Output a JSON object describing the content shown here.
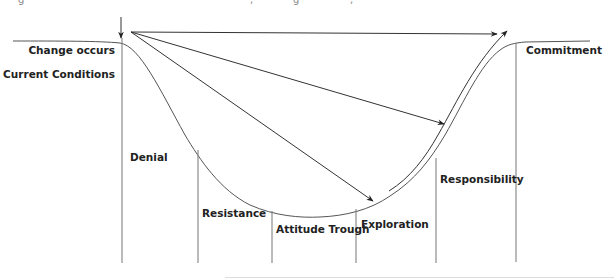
{
  "diagram": {
    "type": "change-curve",
    "labels": {
      "change_occurs": "Change occurs",
      "current_conditions": "Current Conditions",
      "denial": "Denial",
      "resistance": "Resistance",
      "attitude_trough": "Attitude Trough",
      "exploration": "Exploration",
      "responsibility": "Responsibility",
      "commitment": "Commitment"
    },
    "stages": [
      {
        "name": "Denial",
        "x_start": 122,
        "x_end": 198
      },
      {
        "name": "Resistance",
        "x_start": 198,
        "x_end": 272
      },
      {
        "name": "Attitude Trough",
        "x_start": 272,
        "x_end": 356
      },
      {
        "name": "Exploration",
        "x_start": 356,
        "x_end": 436
      },
      {
        "name": "Responsibility",
        "x_start": 436,
        "x_end": 516
      },
      {
        "name": "Commitment",
        "x_start": 516,
        "x_end": 590
      }
    ],
    "arrows": [
      {
        "from": "change-point",
        "to": "commitment-level",
        "kind": "straight"
      },
      {
        "from": "change-point",
        "to": "responsibility",
        "kind": "straight"
      },
      {
        "from": "change-point",
        "to": "exploration",
        "kind": "straight"
      },
      {
        "from": "exploration",
        "to": "commitment",
        "kind": "curved"
      }
    ],
    "colors": {
      "line": "#555555",
      "text": "#222222",
      "background": "#ffffff"
    }
  }
}
